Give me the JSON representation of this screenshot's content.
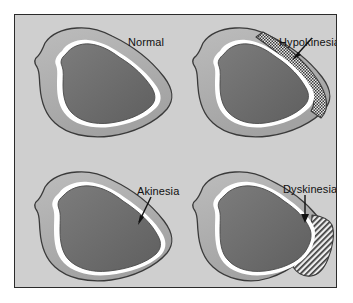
{
  "figure": {
    "background_color": "#ffffff",
    "panel_background_color": "#cfcfcf",
    "border_color": "#2b2b2b",
    "width": 353,
    "height": 303
  },
  "colors": {
    "myocardium": "#b0b0b0",
    "myocardium_shadow": "#9a9a9a",
    "cavity": "#6f6f6f",
    "cavity_dark": "#606060",
    "endocardium": "#ffffff",
    "outline": "#3a3a3a",
    "hatch_line": "#3a3a3a",
    "hatch_background": "#e8e8e8",
    "arrow": "#111111",
    "text": "#111111"
  },
  "panels": [
    {
      "id": "normal",
      "label": "Normal",
      "position": "top-left",
      "has_arrow": false,
      "abnormal_region": "none",
      "description": "Normal left ventricle with uniform wall thickness"
    },
    {
      "id": "hypokinesia",
      "label": "Hypokinesia",
      "position": "top-right",
      "has_arrow": true,
      "arrow_direction": "down-left",
      "abnormal_region": "cross-hatched crescent along lateral wall",
      "hatch_style": "cross-hatch",
      "description": "Reduced wall motion shown as hatched lateral wall segment"
    },
    {
      "id": "akinesia",
      "label": "Akinesia",
      "position": "bottom-left",
      "has_arrow": true,
      "arrow_direction": "down-left",
      "abnormal_region": "thinned non-moving lateral wall",
      "hatch_style": "none",
      "description": "Absent wall motion with thinned lateral wall"
    },
    {
      "id": "dyskinesia",
      "label": "Dyskinesia",
      "position": "bottom-right",
      "has_arrow": true,
      "arrow_direction": "down",
      "abnormal_region": "outward-bulging hatched aneurysmal segment",
      "hatch_style": "diagonal-hatch",
      "description": "Paradoxical outward bulging of the infarcted segment"
    }
  ]
}
